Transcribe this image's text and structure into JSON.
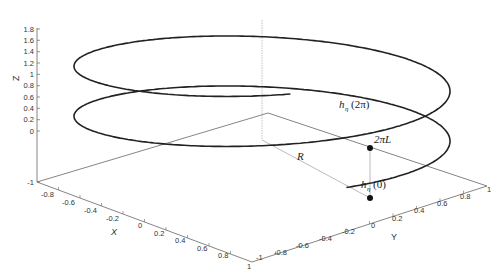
{
  "chart_data": {
    "type": "line3d",
    "title": "",
    "xlabel": "X",
    "ylabel": "Y",
    "zlabel": "Z",
    "xlim": [
      -1,
      1
    ],
    "ylim": [
      -1,
      1
    ],
    "zlim": [
      -1,
      1.8
    ],
    "x_ticks": [
      "-1",
      "-0.8",
      "-0.6",
      "-0.4",
      "-0.2",
      "0",
      "0.2",
      "0.4",
      "0.6",
      "0.8",
      "1"
    ],
    "y_ticks": [
      "-1",
      "-0.8",
      "-0.6",
      "-0.4",
      "-0.2",
      "0",
      "0.2",
      "0.4",
      "0.6",
      "0.8",
      "1"
    ],
    "z_ticks": [
      "-1",
      "0",
      "0.2",
      "0.4",
      "0.6",
      "0.8",
      "1",
      "1.2",
      "1.4",
      "1.6",
      "1.8"
    ],
    "grid": false,
    "series": [
      {
        "name": "helix",
        "param": "t in [0, ~4.2*pi]",
        "radius": 0.9,
        "pitch_per_turn": 0.9,
        "z_start": 0,
        "z_end": 1.8,
        "color": "#222222"
      }
    ],
    "annotations": [
      {
        "label": "h_η(0)",
        "point": "helix start, z = 0"
      },
      {
        "label": "h_η(2π)",
        "point": "after one turn, z = 2πL"
      },
      {
        "label": "2πL",
        "meaning": "vertical distance between h_η(0) and h_η(2π)"
      },
      {
        "label": "R",
        "meaning": "radius from central axis to helix"
      }
    ],
    "colors": {
      "curve": "#222222",
      "axes": "#555555",
      "guides": "#aaaaaa",
      "marker": "#111111"
    }
  },
  "labels": {
    "x_axis": "X",
    "y_axis": "Y",
    "z_axis": "Z",
    "h0_main": "h",
    "h0_sub": "η",
    "h0_arg": "(0)",
    "h2pi_main": "h",
    "h2pi_sub": "η",
    "h2pi_arg": "(2π)",
    "pitch": "2πL",
    "radius": "R"
  }
}
